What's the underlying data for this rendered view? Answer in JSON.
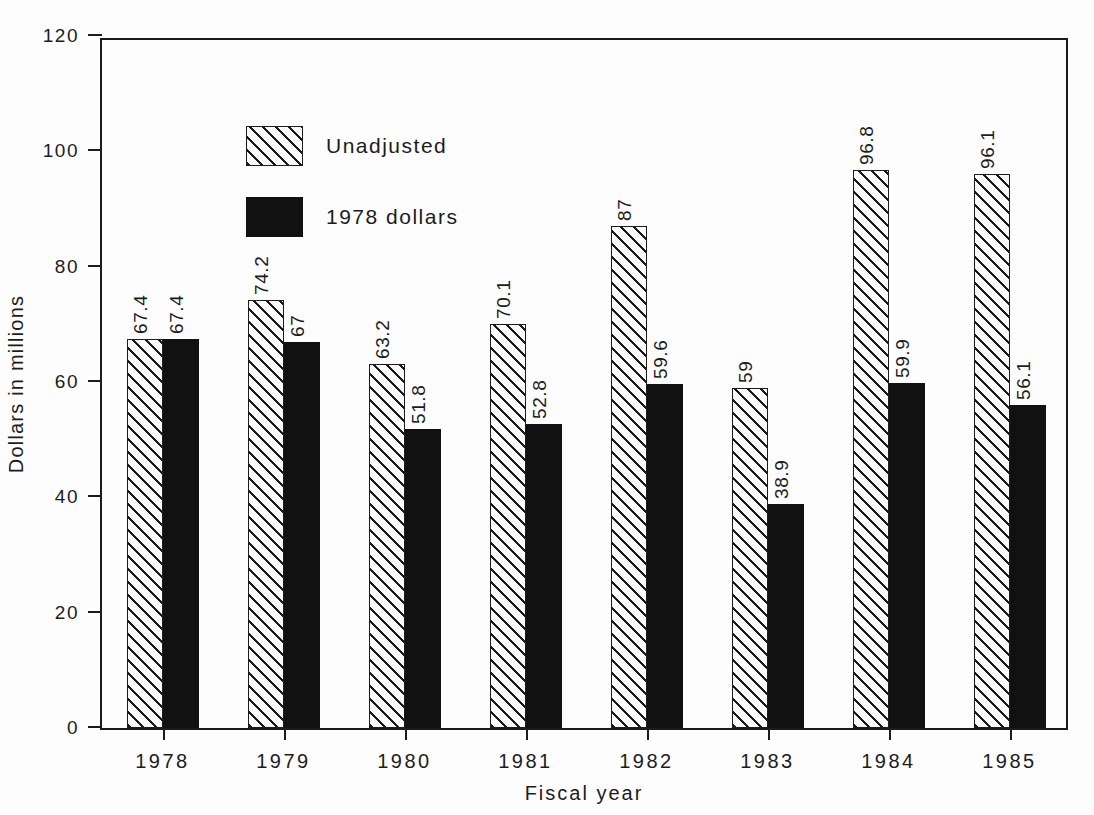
{
  "chart_data": {
    "type": "bar",
    "title": "",
    "subtitle": "",
    "xlabel": "Fiscal year",
    "ylabel": "Dollars in millions",
    "categories": [
      "1978",
      "1979",
      "1980",
      "1981",
      "1982",
      "1983",
      "1984",
      "1985"
    ],
    "series": [
      {
        "name": "Unadjusted",
        "style": "hatched",
        "color": "#1c1c1c",
        "values": [
          67.4,
          74.2,
          63.2,
          70.1,
          87,
          59,
          96.8,
          96.1
        ],
        "labels": [
          "67.4",
          "74.2",
          "63.2",
          "70.1",
          "87",
          "59",
          "96.8",
          "96.1"
        ]
      },
      {
        "name": "1978 dollars",
        "style": "solid",
        "color": "#111111",
        "values": [
          67.4,
          67,
          51.8,
          52.8,
          59.6,
          38.9,
          59.9,
          56.1
        ],
        "labels": [
          "67.4",
          "67",
          "51.8",
          "52.8",
          "59.6",
          "38.9",
          "59.9",
          "56.1"
        ]
      }
    ],
    "ylim": [
      0,
      120
    ],
    "yticks": [
      0,
      20,
      40,
      60,
      80,
      100,
      120
    ],
    "ytick_labels": [
      "0",
      "20",
      "40",
      "60",
      "80",
      "100",
      "120"
    ],
    "grid": false,
    "legend_position": "upper-left",
    "bar_label_rotation": 90
  },
  "legend": {
    "entries": [
      {
        "label": "Unadjusted",
        "style": "hatched"
      },
      {
        "label": "1978 dollars",
        "style": "solid"
      }
    ]
  },
  "colors": {
    "axis": "#1c1c1c",
    "unadjusted_hatch": "#1c1c1c",
    "dollars_1978_fill": "#111111",
    "background": "#fdfdfd"
  }
}
